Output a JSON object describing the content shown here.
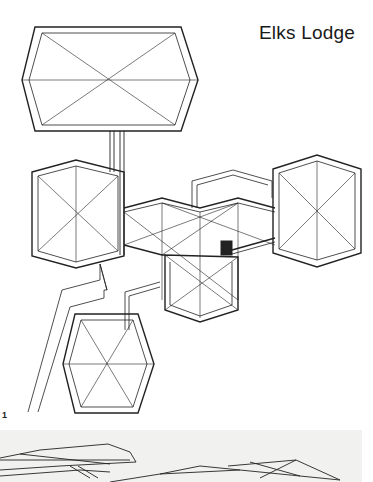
{
  "page": {
    "title": "Elks Lodge",
    "figure_number": "1"
  },
  "figures": [
    {
      "id": "plan",
      "kind": "roof-plan-drawing",
      "label": "1"
    },
    {
      "id": "photo",
      "kind": "perspective-roof-photo"
    }
  ],
  "colors": {
    "ink": "#222222",
    "paper": "#ffffff",
    "photo_background": "#f1f1f0"
  }
}
